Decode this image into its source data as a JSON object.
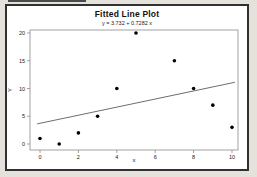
{
  "chart_data": {
    "type": "scatter",
    "title": "Fitted Line Plot",
    "subtitle": "y  =  3.732 + 0.7282 x",
    "xlabel": "x",
    "ylabel": "Y",
    "xlim": [
      0,
      10
    ],
    "ylim": [
      0,
      20
    ],
    "x_ticks": [
      0,
      2,
      4,
      6,
      8,
      10
    ],
    "y_ticks": [
      0,
      5,
      10,
      15,
      20
    ],
    "points": [
      [
        0,
        1
      ],
      [
        1,
        0
      ],
      [
        2,
        2
      ],
      [
        3,
        5
      ],
      [
        4,
        10
      ],
      [
        5,
        20
      ],
      [
        7,
        15
      ],
      [
        8,
        10
      ],
      [
        9,
        7
      ],
      [
        10,
        3
      ]
    ],
    "fit": {
      "intercept": 3.732,
      "slope": 0.7282
    },
    "grid": false,
    "legend": "none",
    "colors": {
      "point": "#000000",
      "fit_line": "#6e6e6e",
      "plot_border": "#8a8a8a",
      "text": "#1a1a1a",
      "plot_bg": "#ffffff",
      "window_bg": "#ffffff",
      "frame": "#313131",
      "outer_bg": "#e4e2da"
    }
  }
}
